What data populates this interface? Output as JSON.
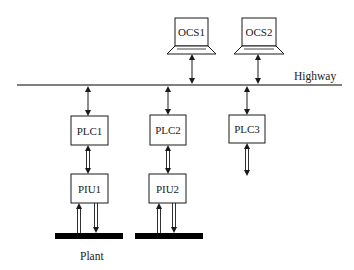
{
  "diagram": {
    "title": "",
    "colors": {
      "line": "#1a1a1a",
      "highway": "#555555",
      "plant_bar": "#000000",
      "box_fill": "#ffffff",
      "text": "#222222"
    },
    "highway": {
      "label": "Highway",
      "x1": 17,
      "x2": 342,
      "y": 85,
      "label_x": 294,
      "label_y": 80
    },
    "workstations": [
      {
        "id": "ocs1",
        "label": "OCS1",
        "screen": {
          "x": 175,
          "y": 18,
          "w": 33,
          "h": 28
        },
        "base": {
          "x1": 167,
          "x2": 216,
          "y": 46,
          "h": 8
        },
        "link_x": 192
      },
      {
        "id": "ocs2",
        "label": "OCS2",
        "screen": {
          "x": 242,
          "y": 18,
          "w": 34,
          "h": 28
        },
        "base": {
          "x1": 234,
          "x2": 284,
          "y": 46,
          "h": 8
        },
        "link_x": 258
      }
    ],
    "plcs": [
      {
        "id": "plc1",
        "label": "PLC1",
        "x": 71,
        "y": 116,
        "w": 37,
        "h": 29,
        "link_x": 88
      },
      {
        "id": "plc2",
        "label": "PLC2",
        "x": 150,
        "y": 115,
        "w": 36,
        "h": 30,
        "link_x": 168
      },
      {
        "id": "plc3",
        "label": "PLC3",
        "x": 229,
        "y": 115,
        "w": 36,
        "h": 28,
        "link_x": 247,
        "down_to": 176
      }
    ],
    "pius": [
      {
        "id": "piu1",
        "label": "PIU1",
        "x": 71,
        "y": 174,
        "w": 37,
        "h": 29,
        "link_x": 88,
        "in_x": 79,
        "out_x": 96
      },
      {
        "id": "piu2",
        "label": "PIU2",
        "x": 149,
        "y": 174,
        "w": 37,
        "h": 29,
        "link_x": 168,
        "in_x": 159,
        "out_x": 174
      }
    ],
    "plant": {
      "label": "Plant",
      "label_x": 80,
      "label_y": 260,
      "bars": [
        {
          "x": 55,
          "y": 233,
          "w": 68,
          "h": 6
        },
        {
          "x": 135,
          "y": 233,
          "w": 68,
          "h": 6
        }
      ]
    }
  }
}
